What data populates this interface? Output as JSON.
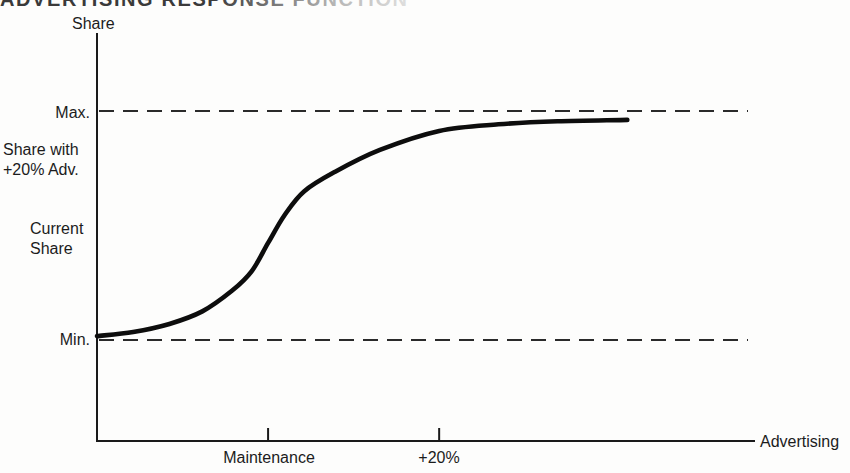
{
  "title": "ADVERTISING RESPONSE FUNCTION",
  "y_axis_title": "Share",
  "x_axis_title": "Advertising",
  "labels": {
    "max": "Max.",
    "share_with_line1": "Share with",
    "share_with_line2": "+20% Adv.",
    "current_line1": "Current",
    "current_line2": "Share",
    "min": "Min.",
    "tick_maintenance": "Maintenance",
    "tick_plus20": "+20%"
  },
  "chart_data": {
    "type": "line",
    "title": "ADVERTISING RESPONSE FUNCTION",
    "xlabel": "Advertising",
    "ylabel": "Share",
    "x_axis": {
      "numeric_scale_shown": false,
      "ticks": [
        {
          "id": "maintenance",
          "label": "Maintenance",
          "position_frac": 0.26
        },
        {
          "id": "plus20",
          "label": "+20%",
          "position_frac": 0.52
        }
      ]
    },
    "y_axis": {
      "numeric_scale_shown": false,
      "reference_levels": [
        {
          "id": "max",
          "label": "Max.",
          "share": 1.0,
          "style": "dashed"
        },
        {
          "id": "share_plus20",
          "label": "Share with +20% Adv.",
          "share": 0.91,
          "style": "label-only"
        },
        {
          "id": "current",
          "label": "Current Share",
          "share": 0.42,
          "style": "label-only"
        },
        {
          "id": "min",
          "label": "Min.",
          "share": 0.0,
          "style": "dashed"
        }
      ]
    },
    "series": [
      {
        "name": "Advertising response S-curve",
        "points": [
          {
            "x_frac": 0.0,
            "share": 0.017
          },
          {
            "x_frac": 0.055,
            "share": 0.035
          },
          {
            "x_frac": 0.11,
            "share": 0.07
          },
          {
            "x_frac": 0.16,
            "share": 0.125
          },
          {
            "x_frac": 0.205,
            "share": 0.215
          },
          {
            "x_frac": 0.235,
            "share": 0.3
          },
          {
            "x_frac": 0.26,
            "share": 0.424
          },
          {
            "x_frac": 0.285,
            "share": 0.545
          },
          {
            "x_frac": 0.315,
            "share": 0.65
          },
          {
            "x_frac": 0.362,
            "share": 0.735
          },
          {
            "x_frac": 0.43,
            "share": 0.83
          },
          {
            "x_frac": 0.52,
            "share": 0.913
          },
          {
            "x_frac": 0.61,
            "share": 0.942
          },
          {
            "x_frac": 0.7,
            "share": 0.955
          },
          {
            "x_frac": 0.806,
            "share": 0.961
          }
        ]
      }
    ],
    "annotations": {
      "share_at_maintenance": "Current Share",
      "share_at_plus20_advertising": "Share with +20% Adv."
    },
    "style": {
      "curve_color": "#0d0d0d",
      "dashed_line_color": "#2a2a2a",
      "axis_color": "#1a1a1a",
      "background": "#fdfdfc"
    }
  }
}
